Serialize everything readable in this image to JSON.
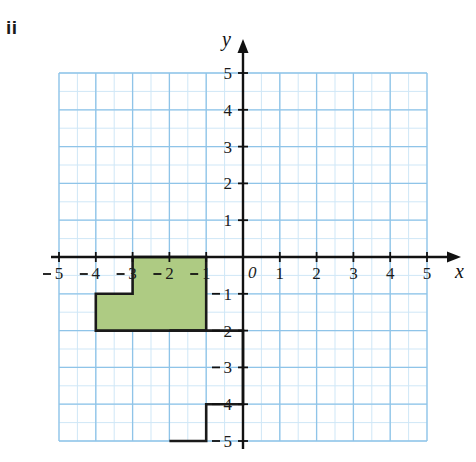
{
  "part_label": "ii",
  "colors": {
    "shape_fill": "#aecb83",
    "shape_stroke": "#1a1a1a",
    "grid_major": "#8fc4e8",
    "grid_minor": "#cfe7f7",
    "axis": "#111111",
    "text": "#1b1b1b",
    "background": "#ffffff"
  },
  "chart_data": {
    "type": "scatter",
    "title": "",
    "xlabel": "x",
    "ylabel": "y",
    "xlim": [
      -5,
      5
    ],
    "ylim": [
      -5,
      5
    ],
    "grid": true,
    "grid_major_step": 1,
    "grid_minor_step": 0.5,
    "legend": null,
    "origin_label": "0",
    "x_ticks": [
      -5,
      -4,
      -3,
      -2,
      -1,
      1,
      2,
      3,
      4,
      5
    ],
    "x_tick_labels": [
      "5",
      "4",
      "3",
      "2",
      "1",
      "1",
      "2",
      "3",
      "4",
      "5"
    ],
    "y_ticks": [
      5,
      4,
      3,
      2,
      1,
      -1,
      -2,
      -3,
      -4,
      -5
    ],
    "y_tick_labels": [
      "5",
      "4",
      "3",
      "2",
      "1",
      "1",
      "2",
      "3",
      "4",
      "5"
    ],
    "shapes": [
      {
        "name": "shaded-polygon",
        "filled": true,
        "fill": "#aecb83",
        "vertices": [
          [
            -3,
            0
          ],
          [
            -1,
            0
          ],
          [
            -1,
            -2
          ],
          [
            -4,
            -2
          ],
          [
            -4,
            -1
          ],
          [
            -3,
            -1
          ]
        ]
      },
      {
        "name": "outline-polygon",
        "filled": false,
        "fill": "none",
        "vertices": [
          [
            -2,
            -2
          ],
          [
            0,
            -2
          ],
          [
            0,
            -4
          ],
          [
            -1,
            -4
          ],
          [
            -1,
            -5
          ],
          [
            -2,
            -5
          ]
        ]
      }
    ]
  },
  "axes": {
    "x_axis_label": "x",
    "y_axis_label": "y"
  }
}
